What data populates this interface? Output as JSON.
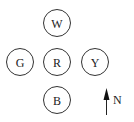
{
  "diagram": {
    "circles": [
      {
        "id": "north",
        "label": "W"
      },
      {
        "id": "west",
        "label": "G"
      },
      {
        "id": "center",
        "label": "R"
      },
      {
        "id": "east",
        "label": "Y"
      },
      {
        "id": "south",
        "label": "B"
      }
    ],
    "compass": {
      "label": "N",
      "icon": "north-arrow-icon"
    },
    "colors": {
      "stroke": "#333333",
      "text": "#222222"
    }
  }
}
